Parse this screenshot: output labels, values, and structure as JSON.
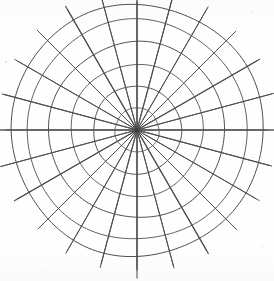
{
  "figure": {
    "background_color": "#fefefe",
    "line_color": "#4f4f4f",
    "line_width": 1,
    "width": 274,
    "height": 281
  },
  "chart_data": {
    "type": "line",
    "title": "",
    "subtitle": "",
    "xlabel": "",
    "ylabel": "",
    "grid": true,
    "legend_position": "none",
    "projection": "polar",
    "center": {
      "x": 137,
      "y": 130
    },
    "series": [
      {
        "name": "radial-rings",
        "values": [
          22,
          44,
          66,
          88,
          110,
          126
        ]
      },
      {
        "name": "angular-spokes",
        "values": [
          0,
          15,
          30,
          45,
          60,
          75,
          90,
          105,
          120,
          135,
          150,
          165,
          180,
          195,
          210,
          225,
          240,
          255,
          270,
          285,
          300,
          315,
          330,
          345
        ]
      }
    ],
    "rings": {
      "count": 6,
      "radii": [
        22,
        44,
        66,
        88,
        110,
        126
      ],
      "units": "px"
    },
    "spokes": {
      "count": 24,
      "angle_step_degrees": 15,
      "angles_degrees": [
        0,
        15,
        30,
        45,
        60,
        75,
        90,
        105,
        120,
        135,
        150,
        165,
        180,
        195,
        210,
        225,
        240,
        255,
        270,
        285,
        300,
        315,
        330,
        345
      ],
      "overshoot_px": 14
    },
    "axis_lines": {
      "horizontal": {
        "label": "0-180 axis",
        "y": 130,
        "x_start": 6,
        "x_end": 268
      },
      "vertical": {
        "label": "90-270 axis",
        "x": 137,
        "y_start": 2,
        "y_end": 278
      }
    },
    "tick_labels": [],
    "annotations": []
  }
}
